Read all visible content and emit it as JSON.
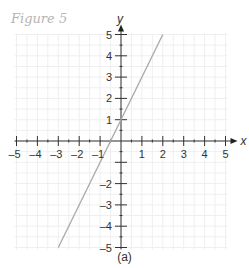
{
  "figure": {
    "title": "Figure 5",
    "caption": "(a)"
  },
  "chart_data": {
    "type": "line",
    "title": "Figure 5",
    "subtitle": "(a)",
    "xlabel": "x",
    "ylabel": "y",
    "xlim": [
      -5,
      5
    ],
    "ylim": [
      -5,
      5
    ],
    "grid": true,
    "x_ticks": [
      -5,
      -4,
      -3,
      -2,
      -1,
      1,
      2,
      3,
      4,
      5
    ],
    "y_ticks": [
      -5,
      -4,
      -3,
      -2,
      1,
      2,
      3,
      4,
      5
    ],
    "x_tick_labels": [
      "–5",
      "–4",
      "–3",
      "–2",
      "–1",
      "1",
      "2",
      "3",
      "4",
      "5"
    ],
    "y_tick_labels": [
      "–5",
      "–4",
      "–3",
      "–2",
      "1",
      "2",
      "3",
      "4",
      "5"
    ],
    "series": [
      {
        "name": "y = 2x + 1",
        "x": [
          -3,
          2
        ],
        "y": [
          -5,
          5
        ],
        "color": "#a8a8a8"
      }
    ],
    "legend": null
  }
}
